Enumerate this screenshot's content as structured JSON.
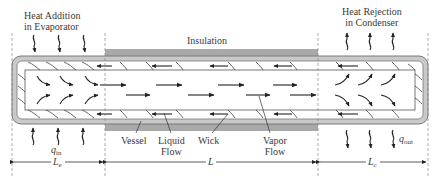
{
  "diagram": {
    "sections": {
      "evaporator": {
        "label_line1": "Heat Addition",
        "label_line2": "in Evaporator",
        "heat_symbol": "q",
        "heat_subscript": "in",
        "length_symbol": "L",
        "length_subscript": "e"
      },
      "adiabatic": {
        "label": "Insulation",
        "length_symbol": "L"
      },
      "condenser": {
        "label_line1": "Heat Rejection",
        "label_line2": "in Condenser",
        "heat_symbol": "q",
        "heat_subscript": "out",
        "length_symbol": "L",
        "length_subscript": "c"
      }
    },
    "callouts": {
      "vessel": "Vessel",
      "liquid_flow_line1": "Liquid",
      "liquid_flow_line2": "Flow",
      "wick": "Wick",
      "vapor_flow_line1": "Vapor",
      "vapor_flow_line2": "Flow"
    },
    "colors": {
      "vessel": "#c8c8c8",
      "vessel_outline": "#8a8a8a",
      "insulation": "#a8a8a8",
      "line": "#333333",
      "dashed": "#888888"
    }
  }
}
